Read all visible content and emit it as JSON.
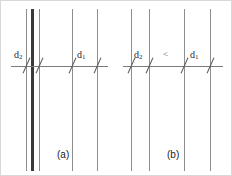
{
  "figure": {
    "width": 232,
    "height": 176,
    "background": "#ffffff",
    "border_color": "#d8d8d8",
    "line_color": "#8e8e8e",
    "thick_line_color": "#3a3a3a",
    "axis_color": "#7b7b7b",
    "tick_color": "#5a5a5a"
  },
  "panels": [
    {
      "id": "a",
      "caption": "(a)",
      "caption_x": 56,
      "caption_y": 149,
      "axis": {
        "x1": 10,
        "x2": 107,
        "y": 65
      },
      "lines": [
        {
          "x": 25,
          "thick": false
        },
        {
          "x": 31,
          "thick": true
        },
        {
          "x": 38,
          "thick": false
        },
        {
          "x": 71,
          "thick": false
        },
        {
          "x": 96,
          "thick": false
        }
      ],
      "ticks": [
        {
          "x": 25
        },
        {
          "x": 38
        },
        {
          "x": 71
        },
        {
          "x": 96
        }
      ],
      "labels": [
        {
          "name": "spacing-d2",
          "base": "d",
          "sub": "2",
          "x": 13,
          "y": 49
        },
        {
          "name": "spacing-d1",
          "base": "d",
          "sub": "1",
          "x": 76,
          "y": 49
        }
      ]
    },
    {
      "id": "b",
      "caption": "(b)",
      "caption_x": 166,
      "caption_y": 149,
      "axis": {
        "x1": 122,
        "x2": 222,
        "y": 65
      },
      "lines": [
        {
          "x": 130,
          "thick": false
        },
        {
          "x": 148,
          "thick": false
        },
        {
          "x": 183,
          "thick": false
        },
        {
          "x": 209,
          "thick": false
        }
      ],
      "ticks": [
        {
          "x": 130
        },
        {
          "x": 148
        },
        {
          "x": 183
        },
        {
          "x": 209
        }
      ],
      "labels": [
        {
          "name": "spacing-d2",
          "base": "d",
          "sub": "2",
          "x": 133,
          "y": 49
        },
        {
          "name": "spacing-d1",
          "base": "d",
          "sub": "1",
          "x": 189,
          "y": 49
        }
      ],
      "relation": {
        "symbol": "<",
        "x": 162,
        "y": 49
      }
    }
  ]
}
